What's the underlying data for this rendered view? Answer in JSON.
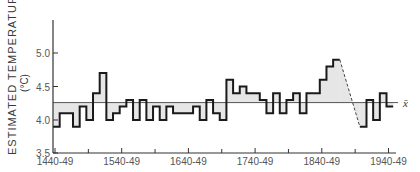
{
  "chart_data": {
    "type": "line",
    "subtype": "step",
    "title": "",
    "xlabel": "",
    "ylabel": "ESTIMATED TEMPERATURE",
    "ylabel_unit": "(°C)",
    "ylim": [
      3.5,
      5.4
    ],
    "xlim": [
      1440,
      1960
    ],
    "y_ticks": [
      "3.5",
      "4.0",
      "4.5",
      "5.0"
    ],
    "y_tick_values": [
      3.5,
      4.0,
      4.5,
      5.0
    ],
    "x_tick_labels": [
      "1440-49",
      "1540-49",
      "1640-49",
      "1740-49",
      "1840-49",
      "1940-49"
    ],
    "x_tick_label_years": [
      1440,
      1540,
      1640,
      1740,
      1840,
      1940
    ],
    "x_minor_ticks": [
      1490,
      1590,
      1690,
      1790,
      1890
    ],
    "grid": false,
    "mean": {
      "label": "x̄",
      "value": 4.26
    },
    "series": [
      {
        "name": "Estimated decadal temperature",
        "x_decades": [
          1440,
          1450,
          1460,
          1470,
          1480,
          1490,
          1500,
          1510,
          1520,
          1530,
          1540,
          1550,
          1560,
          1570,
          1580,
          1590,
          1600,
          1610,
          1620,
          1630,
          1640,
          1650,
          1660,
          1670,
          1680,
          1690,
          1700,
          1710,
          1720,
          1730,
          1740,
          1750,
          1760,
          1770,
          1780,
          1790,
          1800,
          1810,
          1820,
          1830,
          1840,
          1850,
          1860
        ],
        "values": [
          3.9,
          4.1,
          4.1,
          3.9,
          4.2,
          4.0,
          4.4,
          4.7,
          4.0,
          4.1,
          4.2,
          4.3,
          4.0,
          4.3,
          4.0,
          4.2,
          4.0,
          4.2,
          4.1,
          4.1,
          4.1,
          4.2,
          4.0,
          4.3,
          4.1,
          4.0,
          4.6,
          4.4,
          4.5,
          4.4,
          4.4,
          4.3,
          4.1,
          4.4,
          4.1,
          4.3,
          4.4,
          4.1,
          4.4,
          4.4,
          4.6,
          4.8,
          4.9
        ]
      },
      {
        "name": "Estimated decadal temperature (after gap)",
        "x_decades": [
          1900,
          1910,
          1920,
          1930,
          1940
        ],
        "values": [
          3.9,
          4.3,
          4.0,
          4.4,
          4.2
        ]
      }
    ],
    "annotations": [
      {
        "type": "dashed-line",
        "from": [
          1870,
          4.9
        ],
        "to": [
          1900,
          3.9
        ],
        "note": "interpolated gap"
      },
      {
        "type": "shaded-area",
        "between": "series and mean"
      }
    ]
  },
  "axes": {
    "ylabel": "ESTIMATED TEMPERATURE",
    "yunit": "(°C)",
    "mean_label": "x̄"
  },
  "colors": {
    "line": "#1a1a1a",
    "shade": "#e6e6e6",
    "axis": "#333333",
    "text": "#444444"
  }
}
